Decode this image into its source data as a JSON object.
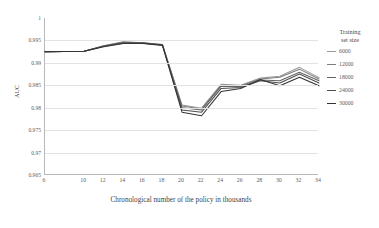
{
  "chart_data": {
    "type": "line",
    "title": "",
    "xlabel": "Chronological number of the policy in thousands",
    "ylabel": "AUC",
    "x": [
      6,
      10,
      12,
      14,
      16,
      18,
      20,
      22,
      24,
      26,
      28,
      30,
      32,
      34
    ],
    "xlim": [
      6,
      34
    ],
    "ylim": [
      0.965,
      1
    ],
    "xticks": [
      "6",
      "10",
      "12",
      "14",
      "16",
      "18",
      "20",
      "22",
      "24",
      "26",
      "28",
      "30",
      "32",
      "34"
    ],
    "yticks": [
      "1",
      "0.995",
      "0.99",
      "0.985",
      "0.98",
      "0.975",
      "0.97",
      "0.965"
    ],
    "grid": true,
    "legend_position": "right",
    "legend_title_line1": "Training",
    "legend_title_line2": "set size",
    "series": [
      {
        "name": "6000",
        "color": "#9a9a9a",
        "values": [
          0.9925,
          0.9926,
          0.9938,
          0.9946,
          0.9945,
          0.9941,
          0.9806,
          0.9799,
          0.9852,
          0.985,
          0.9866,
          0.987,
          0.989,
          0.9867
        ]
      },
      {
        "name": "12000",
        "color": "#7d7d7d",
        "values": [
          0.9925,
          0.9926,
          0.9938,
          0.9947,
          0.9945,
          0.9941,
          0.9804,
          0.9797,
          0.985,
          0.9849,
          0.9864,
          0.9868,
          0.9886,
          0.9864
        ]
      },
      {
        "name": "18000",
        "color": "#636363",
        "values": [
          0.9925,
          0.9926,
          0.9937,
          0.9945,
          0.9944,
          0.994,
          0.98,
          0.9795,
          0.9848,
          0.9847,
          0.9862,
          0.986,
          0.9879,
          0.986
        ]
      },
      {
        "name": "24000",
        "color": "#4d4d4d",
        "values": [
          0.9925,
          0.9926,
          0.9937,
          0.9944,
          0.9944,
          0.994,
          0.9795,
          0.979,
          0.9843,
          0.9845,
          0.986,
          0.9855,
          0.9875,
          0.9855
        ]
      },
      {
        "name": "30000",
        "color": "#333333",
        "values": [
          0.9925,
          0.9926,
          0.9936,
          0.9943,
          0.9943,
          0.9939,
          0.979,
          0.9782,
          0.9836,
          0.9843,
          0.9863,
          0.9849,
          0.9868,
          0.9849
        ]
      }
    ],
    "legend_entries": [
      "6000",
      "12000",
      "18000",
      "24000",
      "30000"
    ]
  }
}
